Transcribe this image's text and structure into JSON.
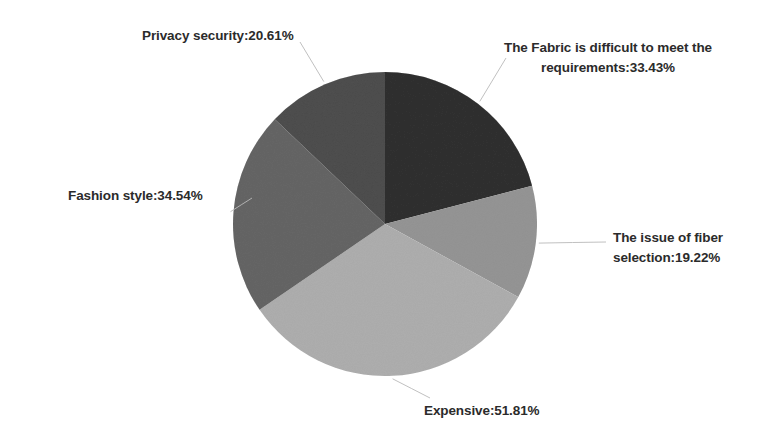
{
  "chart_data": {
    "type": "pie",
    "title": "",
    "subtitle": "",
    "xlabel": "",
    "ylabel": "",
    "legend_position": "none",
    "grid": false,
    "label_format": "{category}:{value}%",
    "note": "Multi-response survey percentages; values sum to more than 100%.",
    "total_percent": 159.61,
    "categories": [
      "The Fabric is difficult to meet the requirements",
      "The issue of fiber selection",
      "Expensive",
      "Fashion style",
      "Privacy security"
    ],
    "values": [
      33.43,
      19.22,
      51.81,
      34.54,
      20.61
    ],
    "colors": [
      "#6f6f6f",
      "#c2c2c2",
      "#d2d2d2",
      "#a0a0a0",
      "#8d8d8d"
    ],
    "slices": [
      {
        "id": "fabric",
        "category": "The Fabric is difficult to meet the requirements",
        "value": 33.43,
        "color": "#6f6f6f",
        "label_lines": [
          "The Fabric is difficult to meet the",
          "requirements:33.43%"
        ],
        "label_text": "The Fabric is difficult to meet the\nrequirements:33.43%"
      },
      {
        "id": "fiber",
        "category": "The issue of fiber selection",
        "value": 19.22,
        "color": "#c2c2c2",
        "label_lines": [
          "The issue of fiber",
          "selection:19.22%"
        ],
        "label_text": "The issue of fiber\nselection:19.22%"
      },
      {
        "id": "expensive",
        "category": "Expensive",
        "value": 51.81,
        "color": "#d2d2d2",
        "label_lines": [
          "Expensive:51.81%"
        ],
        "label_text": "Expensive:51.81%"
      },
      {
        "id": "fashion",
        "category": "Fashion style",
        "value": 34.54,
        "color": "#a0a0a0",
        "label_lines": [
          "Fashion style:34.54%"
        ],
        "label_text": "Fashion style:34.54%"
      },
      {
        "id": "privacy",
        "category": "Privacy security",
        "value": 20.61,
        "color": "#8d8d8d",
        "label_lines": [
          "Privacy security:20.61%"
        ],
        "label_text": "Privacy security:20.61%"
      }
    ],
    "geometry": {
      "center_x": 385,
      "center_y": 224,
      "radius": 152
    }
  }
}
